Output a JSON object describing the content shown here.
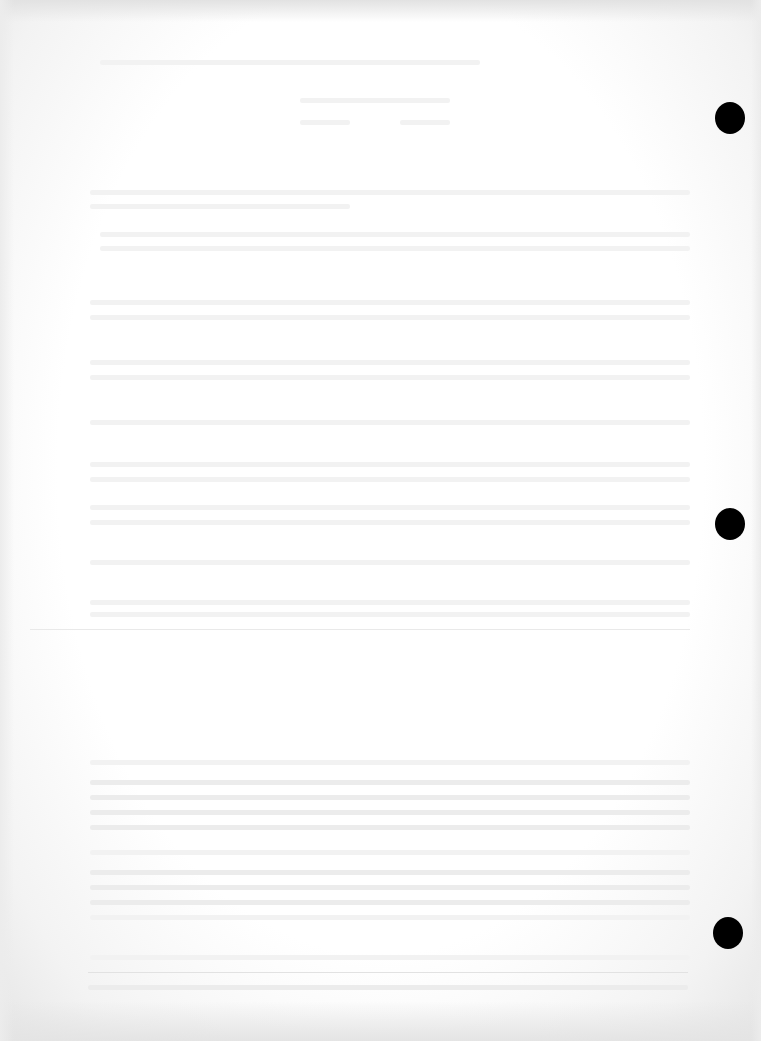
{
  "document": {
    "type": "scanned-page",
    "background_color": "#ffffff",
    "edge_shadow_color": "#e4e4e4",
    "text_legible": false
  },
  "punch_holes": [
    {
      "x": 730,
      "y": 118
    },
    {
      "x": 730,
      "y": 524
    },
    {
      "x": 728,
      "y": 933
    }
  ],
  "rules": [
    {
      "y": 629,
      "x1": 30,
      "x2": 690
    },
    {
      "y": 972,
      "x1": 88,
      "x2": 688
    }
  ]
}
